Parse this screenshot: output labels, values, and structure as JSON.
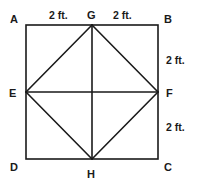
{
  "diagram": {
    "type": "geometry-square-inscribed-rhombus",
    "points": {
      "A": {
        "label": "A",
        "x": 26,
        "y": 25
      },
      "B": {
        "label": "B",
        "x": 158,
        "y": 25
      },
      "C": {
        "label": "C",
        "x": 158,
        "y": 159
      },
      "D": {
        "label": "D",
        "x": 26,
        "y": 159
      },
      "G": {
        "label": "G",
        "x": 92,
        "y": 25
      },
      "H": {
        "label": "H",
        "x": 92,
        "y": 159
      },
      "E": {
        "label": "E",
        "x": 26,
        "y": 92
      },
      "F": {
        "label": "F",
        "x": 158,
        "y": 92
      }
    },
    "segments": [
      [
        "A",
        "B"
      ],
      [
        "B",
        "C"
      ],
      [
        "C",
        "D"
      ],
      [
        "D",
        "A"
      ],
      [
        "G",
        "E"
      ],
      [
        "E",
        "H"
      ],
      [
        "H",
        "F"
      ],
      [
        "F",
        "G"
      ],
      [
        "G",
        "H"
      ],
      [
        "E",
        "F"
      ]
    ],
    "dimensions": {
      "AG": "2 ft.",
      "GB": "2 ft.",
      "BF": "2 ft.",
      "FC": "2 ft."
    }
  }
}
